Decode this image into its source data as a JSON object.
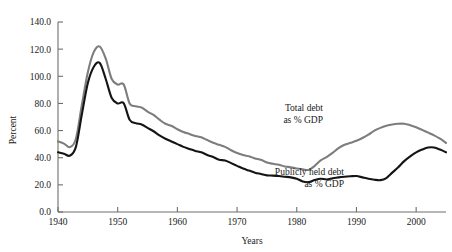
{
  "chart_data": {
    "type": "line",
    "title": "",
    "xlabel": "Years",
    "ylabel": "Percent",
    "xlim": [
      1940,
      2005
    ],
    "ylim": [
      0.0,
      140.0
    ],
    "grid": false,
    "legend_position": "inline-annotation",
    "xticks": [
      "1940",
      "1950",
      "1960",
      "1970",
      "1980",
      "1990",
      "2000"
    ],
    "xtick_values": [
      1940,
      1950,
      1960,
      1970,
      1980,
      1990,
      2000
    ],
    "yticks": [
      "0.0",
      "20.0",
      "40.0",
      "60.0",
      "80.0",
      "100.0",
      "120.0",
      "140.0"
    ],
    "ytick_values": [
      0,
      20,
      40,
      60,
      80,
      100,
      120,
      140
    ],
    "x": [
      1940,
      1941,
      1942,
      1943,
      1944,
      1945,
      1946,
      1947,
      1948,
      1949,
      1950,
      1951,
      1952,
      1953,
      1954,
      1955,
      1956,
      1957,
      1958,
      1959,
      1960,
      1961,
      1962,
      1963,
      1964,
      1965,
      1966,
      1967,
      1968,
      1969,
      1970,
      1971,
      1972,
      1973,
      1974,
      1975,
      1976,
      1977,
      1978,
      1979,
      1980,
      1981,
      1982,
      1983,
      1984,
      1985,
      1986,
      1987,
      1988,
      1989,
      1990,
      1991,
      1992,
      1993,
      1994,
      1995,
      1996,
      1997,
      1998,
      1999,
      2000,
      2001,
      2002,
      2003,
      2004,
      2005
    ],
    "series": [
      {
        "name": "Total debt as % GDP",
        "color": "#7d7d7d",
        "values": [
          52.0,
          50.4,
          47.8,
          54.0,
          79.0,
          103.0,
          118.0,
          121.9,
          113.0,
          98.0,
          93.9,
          94.0,
          80.0,
          78.0,
          77.0,
          74.0,
          71.5,
          68.0,
          65.0,
          63.5,
          61.0,
          59.0,
          57.5,
          56.0,
          55.0,
          53.0,
          51.0,
          49.5,
          48.0,
          45.5,
          43.5,
          42.0,
          41.0,
          39.5,
          38.5,
          36.5,
          35.5,
          34.8,
          33.5,
          33.0,
          32.0,
          31.5,
          31.0,
          34.0,
          38.0,
          40.5,
          43.5,
          47.0,
          49.5,
          51.0,
          52.5,
          54.5,
          57.0,
          60.0,
          62.0,
          63.5,
          64.5,
          65.0,
          65.0,
          64.0,
          62.5,
          60.5,
          58.5,
          56.5,
          54.0,
          51.0
        ]
      },
      {
        "name": "Publicly held debt as % GDP",
        "color": "#141414",
        "values": [
          44.0,
          43.0,
          41.5,
          48.0,
          72.0,
          95.0,
          107.0,
          109.8,
          98.0,
          84.0,
          80.0,
          80.2,
          68.0,
          65.5,
          64.5,
          62.0,
          59.5,
          56.5,
          54.0,
          52.0,
          50.0,
          48.0,
          46.5,
          45.0,
          44.0,
          42.0,
          40.5,
          38.5,
          38.0,
          36.0,
          34.0,
          32.0,
          30.5,
          29.0,
          28.0,
          27.0,
          26.8,
          26.5,
          26.0,
          25.5,
          24.5,
          22.5,
          22.0,
          23.5,
          24.5,
          24.0,
          24.8,
          25.5,
          26.0,
          26.3,
          26.5,
          25.5,
          24.5,
          23.8,
          23.5,
          25.0,
          29.0,
          33.0,
          37.5,
          41.0,
          44.0,
          46.0,
          47.5,
          47.5,
          46.0,
          44.0
        ]
      }
    ],
    "annotations": [
      {
        "name": "total-debt-label",
        "lines": [
          "Total debt",
          "as % GDP"
        ],
        "x_px": 323,
        "y_px": 111
      },
      {
        "name": "publicly-held-debt-label",
        "lines": [
          "Publicly held debt",
          "as % GDP"
        ],
        "x_px": 344,
        "y_px": 175
      }
    ]
  }
}
